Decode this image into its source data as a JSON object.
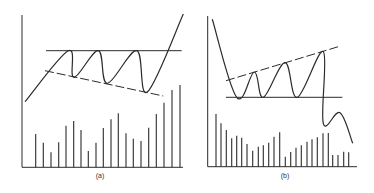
{
  "figure": {
    "panels": [
      {
        "id": "a",
        "label": "(a)",
        "label_pos": {
          "x": 100,
          "y": 176
        },
        "axis": {
          "x0": 22,
          "y_top": 15,
          "y_base": 167.3,
          "x_end": 183
        },
        "resistance_line": {
          "style": "solid",
          "x1": 46,
          "y1": 50.7,
          "x2": 181.7,
          "y2": 50.7
        },
        "support_line": {
          "style": "dashed",
          "x1": 45,
          "y1": 70.7,
          "x2": 163.3,
          "y2": 96
        },
        "price_path": [
          [
            25,
            101.7
          ],
          [
            68.3,
            50.7
          ],
          [
            74,
            77.3
          ],
          [
            98.3,
            50.7
          ],
          [
            107.3,
            83.3
          ],
          [
            136.7,
            50.7
          ],
          [
            147.3,
            92
          ],
          [
            183.3,
            14
          ]
        ],
        "volume_bars": {
          "x": [
            35.7,
            43.3,
            51,
            58.7,
            66,
            73.7,
            81,
            88.3,
            96,
            103.3,
            111,
            118.3,
            126,
            133.3,
            141,
            148.7,
            156.3,
            164,
            172,
            180
          ],
          "top": [
            134,
            142.7,
            152.3,
            142.3,
            125.7,
            121,
            130,
            151,
            142.7,
            128,
            119.3,
            113.3,
            133.3,
            138.7,
            141,
            127.7,
            114,
            102.7,
            90,
            85
          ]
        }
      },
      {
        "id": "b",
        "label": "(b)",
        "label_pos": {
          "x": 285,
          "y": 176
        },
        "axis": {
          "x0": 207.7,
          "y_top": 16,
          "y_base": 166.7,
          "x_end": 357
        },
        "resistance_line": {
          "style": "dashed",
          "x1": 226,
          "y1": 80.7,
          "x2": 338.3,
          "y2": 46.7
        },
        "support_line": {
          "style": "solid",
          "x1": 226,
          "y1": 97.3,
          "x2": 342.3,
          "y2": 97.3
        },
        "price_path": [
          [
            212.3,
            19.3
          ],
          [
            236.7,
            97.3
          ],
          [
            254.3,
            72
          ],
          [
            263.3,
            97.3
          ],
          [
            285,
            62.7
          ],
          [
            297.3,
            97.3
          ],
          [
            323.3,
            51.7
          ],
          [
            323.3,
            123.3
          ],
          [
            340,
            112.7
          ],
          [
            352.7,
            143.3
          ]
        ],
        "volume_bars": {
          "x": [
            216,
            221,
            226.3,
            231.7,
            236.7,
            241.7,
            247,
            252.7,
            258.3,
            263.3,
            268.7,
            274,
            279.7,
            285.3,
            290.7,
            296,
            301.3,
            307,
            312,
            317.3,
            323,
            328.3,
            332.7,
            338,
            343.7,
            348.7
          ],
          "top": [
            114,
            123.3,
            130,
            138.3,
            135.7,
            137.7,
            144,
            150.7,
            146.7,
            145.3,
            142.7,
            136.7,
            132.3,
            156.7,
            152,
            147.7,
            145.3,
            141.7,
            139.3,
            137.3,
            133.3,
            133,
            155,
            155,
            151.7,
            152.3
          ]
        }
      }
    ],
    "colors": {
      "ink": "#2b2b2b",
      "background": "#ffffff"
    }
  }
}
